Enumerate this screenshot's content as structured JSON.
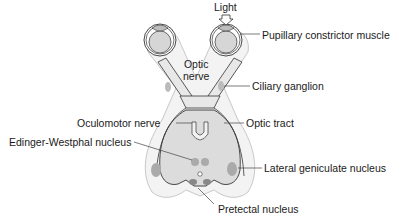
{
  "diagram": {
    "labels": {
      "light": "Light",
      "pupillary_constrictor": "Pupillary constrictor muscle",
      "optic_nerve_line1": "Optic",
      "optic_nerve_line2": "nerve",
      "ciliary_ganglion": "Ciliary ganglion",
      "oculomotor_nerve": "Oculomotor nerve",
      "optic_tract": "Optic tract",
      "edinger_westphal": "Edinger-Westphal nucleus",
      "lateral_geniculate": "Lateral geniculate nucleus",
      "pretectal": "Pretectal nucleus"
    },
    "colors": {
      "structure_fill": "#d9d9d9",
      "outline": "#333333",
      "nucleus_fill": "#a8a8a8",
      "background_fill": "#f2f2f2"
    }
  }
}
